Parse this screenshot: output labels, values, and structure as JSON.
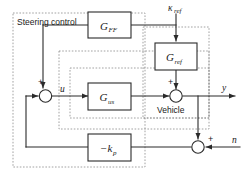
{
  "diagram": {
    "group_label": "Steering control",
    "vehicle_label": "Vehicle",
    "blocks": [
      {
        "id": "g_ff",
        "name": "G",
        "subscript": "FF",
        "label": "G_FF"
      },
      {
        "id": "g_ref",
        "name": "G",
        "subscript": "ref",
        "label": "G_ref"
      },
      {
        "id": "g_us",
        "name": "G",
        "subscript": "us",
        "label": "G_us"
      },
      {
        "id": "k_p",
        "name": "−k",
        "subscript": "p",
        "label": "-k_p"
      }
    ],
    "signals": {
      "kappa_ref_symbol": "κ",
      "kappa_ref_subscript": "ref",
      "control_input": "u",
      "output": "y",
      "noise": "n"
    },
    "signs": {
      "left_sum_top": "+",
      "right_sum_top": "+",
      "noise_sum_right": "+"
    },
    "colors": {
      "line": "#2a2a2a",
      "dashed": "#8c8c8c",
      "background": "#ffffff",
      "text": "#1a1a1a"
    }
  }
}
